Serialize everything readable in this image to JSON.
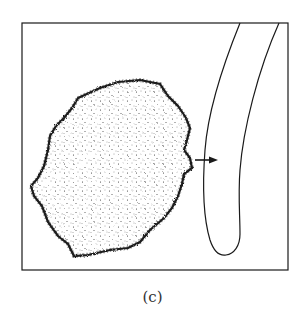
{
  "figure": {
    "caption": "(c)",
    "elements": [
      {
        "name": "irregular-stippled-particle",
        "description": "irregular stippled blob on left"
      },
      {
        "name": "tube-wall",
        "description": "curved elongated tube shape on right, open at top"
      },
      {
        "name": "direction-arrow",
        "description": "arrow pointing right from blob toward tube"
      }
    ],
    "colors": {
      "stroke": "#1a1a1a",
      "background": "#ffffff"
    }
  }
}
